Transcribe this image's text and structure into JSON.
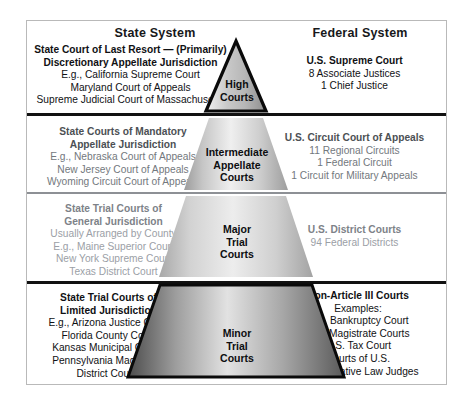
{
  "diagram": {
    "title_state": "State System",
    "title_federal": "Federal System"
  },
  "pyramid": {
    "levels": [
      {
        "id": "high",
        "label_lines": [
          "High",
          "Courts"
        ]
      },
      {
        "id": "intermediate",
        "label_lines": [
          "Intermediate",
          "Appellate",
          "Courts"
        ]
      },
      {
        "id": "major",
        "label_lines": [
          "Major",
          "Trial",
          "Courts"
        ]
      },
      {
        "id": "minor",
        "label_lines": [
          "Minor",
          "Trial",
          "Courts"
        ]
      }
    ]
  },
  "state": {
    "tier1": {
      "bold": [
        "State Court of Last Resort — (Primarily)",
        "Discretionary Appellate Jurisdiction"
      ],
      "normal": [
        "E.g., California Supreme Court",
        "Maryland Court of Appeals",
        "Supreme Judicial Court of Massachusetts"
      ]
    },
    "tier2": {
      "bold": [
        "State Courts of Mandatory",
        "Appellate Jurisdiction"
      ],
      "normal": [
        "E.g., Nebraska Court of Appeals",
        "New Jersey Court of Appeals",
        "Wyoming Circuit Court of Appeals"
      ]
    },
    "tier3": {
      "bold": [
        "State Trial Courts of",
        "General Jurisdiction"
      ],
      "normal": [
        "Usually Arranged by County",
        "E.g., Maine Superior Court",
        "New York Supreme Court",
        "Texas District Court"
      ]
    },
    "tier4": {
      "bold": [
        "State Trial Courts of",
        "Limited Jurisdiction"
      ],
      "normal": [
        "E.g., Arizona Justice Court",
        "Florida County Court",
        "Kansas Municipal Courts",
        "Pennsylvania Magisterial",
        "District Courts"
      ]
    }
  },
  "federal": {
    "tier1": {
      "bold": [
        "U.S. Supreme Court"
      ],
      "normal": [
        "8 Associate Justices",
        "1 Chief Justice"
      ]
    },
    "tier2": {
      "bold": [
        "U.S. Circuit Court of Appeals"
      ],
      "normal": [
        "11 Regional Circuits",
        "1 Federal Circuit",
        "1 Circuit for Military Appeals"
      ]
    },
    "tier3": {
      "bold": [
        "U.S. District Courts"
      ],
      "normal": [
        "94 Federal Districts"
      ]
    },
    "tier4": {
      "bold": [
        "Non-Article III Courts"
      ],
      "normal": [
        "Examples:",
        "U.S. Bankruptcy Court",
        "U.S. Magistrate Courts",
        "U.S. Tax Court",
        "Courts of U.S.",
        "Administrative Law Judges"
      ]
    }
  },
  "colors": {
    "frame_border": "#b9b9b9",
    "rule_black": "#111111",
    "rule_gray": "#8d9095",
    "text_dark": "#101114",
    "text_mid": "#73787d",
    "text_light": "#9ba0a6"
  }
}
